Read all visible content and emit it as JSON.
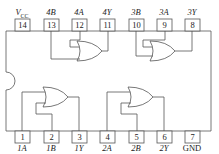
{
  "diagram": {
    "type": "IC pinout",
    "gate_type": "2-input OR (quad)",
    "top_pins": [
      {
        "num": "14",
        "name": "V",
        "sub": "CC"
      },
      {
        "num": "13",
        "name": "4B"
      },
      {
        "num": "12",
        "name": "4A"
      },
      {
        "num": "11",
        "name": "4Y"
      },
      {
        "num": "10",
        "name": "3B"
      },
      {
        "num": "9",
        "name": "3A"
      },
      {
        "num": "8",
        "name": "3Y"
      }
    ],
    "bottom_pins": [
      {
        "num": "1",
        "name": "1A"
      },
      {
        "num": "2",
        "name": "1B"
      },
      {
        "num": "3",
        "name": "1Y"
      },
      {
        "num": "4",
        "name": "2A"
      },
      {
        "num": "5",
        "name": "2B"
      },
      {
        "num": "6",
        "name": "2Y"
      },
      {
        "num": "7",
        "name": "GND"
      }
    ],
    "colors": {
      "line": "#444444",
      "background": "#ffffff"
    }
  }
}
